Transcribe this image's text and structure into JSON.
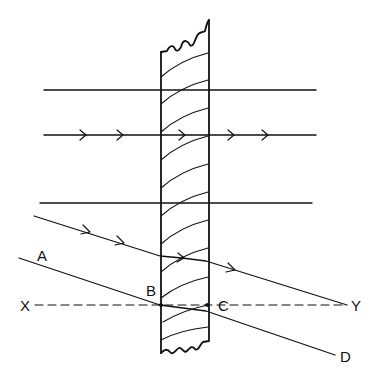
{
  "diagram": {
    "type": "optics-ray-diagram",
    "colors": {
      "stroke": "#111111",
      "background": "#ffffff"
    },
    "labels": {
      "A": "A",
      "B": "B",
      "C": "C",
      "D": "D",
      "X": "X",
      "Y": "Y"
    },
    "slab": {
      "left_x": 161,
      "right_x": 209,
      "top_y": 20,
      "bottom_y": 355,
      "curved_lines": 11
    },
    "horizontal_rays": [
      {
        "y": 90,
        "arrows": 0
      },
      {
        "y": 135,
        "arrows": 5
      },
      {
        "y": 203,
        "arrows": 0
      }
    ],
    "oblique_ray": {
      "arrows": 4
    },
    "reference_line": {
      "name": "XY",
      "style": "dashed"
    },
    "incident_line": {
      "name": "ABCD"
    }
  }
}
